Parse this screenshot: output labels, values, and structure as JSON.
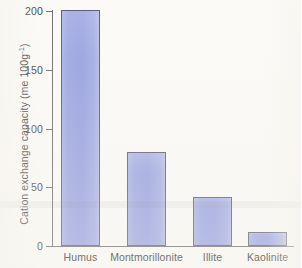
{
  "chart_data": {
    "type": "bar",
    "title": "",
    "xlabel": "",
    "ylabel": "Cation exchange capacity (me 100g",
    "ylabel_sup": "-1",
    "ylabel_tail": ")",
    "categories": [
      "Humus",
      "Montmorillonite",
      "Illite",
      "Kaolinite"
    ],
    "values": [
      201,
      80,
      42,
      12
    ],
    "ylim": [
      0,
      200
    ],
    "yticks": [
      0,
      50,
      100,
      150,
      200
    ],
    "ytick_labels": [
      "0",
      "50",
      "100",
      "150",
      "200"
    ],
    "grid": false,
    "legend": null,
    "bar_color": "#9ba5e1",
    "bar_edge_color": "#5b5d73",
    "axis_color": "#6f6f6f",
    "background_color": "#fbfaf7",
    "text_color": "#2f2f2f"
  }
}
